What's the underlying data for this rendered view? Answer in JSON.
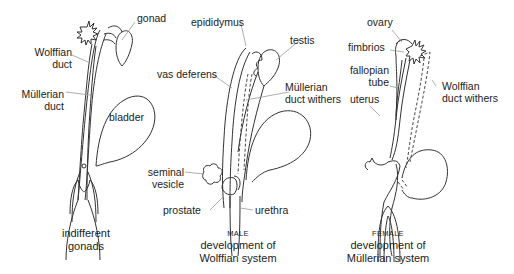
{
  "panels": [
    {
      "id": "indifferent",
      "caption_sub": "",
      "caption": [
        "indifferent",
        "gonads"
      ],
      "labels": {
        "gonad": "gonad",
        "wolffian_duct": [
          "Wolffian",
          "duct"
        ],
        "mullerian_duct": [
          "Müllerian",
          "duct"
        ],
        "bladder": "bladder"
      }
    },
    {
      "id": "male",
      "caption_sub": "MALE",
      "caption": [
        "development of",
        "Wolffian system"
      ],
      "labels": {
        "epididymus": "epididymus",
        "testis": "testis",
        "vas_deferens": "vas deferens",
        "mullerian_withers": [
          "Müllerian",
          "duct withers"
        ],
        "seminal_vesicle": [
          "seminal",
          "vesicle"
        ],
        "prostate": "prostate",
        "urethra": "urethra"
      }
    },
    {
      "id": "female",
      "caption_sub": "FEMALE",
      "caption": [
        "development of",
        "Müllerian system"
      ],
      "labels": {
        "ovary": "ovary",
        "fimbrios": "fimbrios",
        "fallopian_tube": [
          "fallopian",
          "tube"
        ],
        "uterus": "uterus",
        "wolffian_withers": [
          "Wolffian",
          "duct withers"
        ]
      }
    }
  ]
}
